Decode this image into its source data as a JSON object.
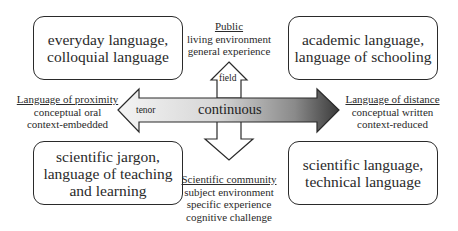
{
  "boxes": {
    "top_left": {
      "lines": [
        "everyday language,",
        "colloquial language"
      ]
    },
    "top_right": {
      "lines": [
        "academic language,",
        "language of schooling"
      ]
    },
    "bottom_left": {
      "lines": [
        "scientific jargon,",
        "language of teaching",
        "and learning"
      ]
    },
    "bottom_right": {
      "lines": [
        "scientific language,",
        "technical language"
      ]
    }
  },
  "poles": {
    "top": {
      "heading": "Public",
      "lines": [
        "living environment",
        "general experience"
      ]
    },
    "bottom": {
      "heading": "Scientific community",
      "lines": [
        "subject environment",
        "specific experience",
        "cognitive challenge"
      ]
    },
    "left": {
      "heading": "Language of proximity",
      "lines": [
        "conceptual oral",
        "context-embedded"
      ]
    },
    "right": {
      "heading": "Language of distance",
      "lines": [
        "conceptual written",
        "context-reduced"
      ]
    }
  },
  "arrows": {
    "horizontal_center_label": "continuous",
    "horizontal_side_label": "tenor",
    "vertical_label": "field",
    "colors": {
      "gradient_light": "#f2f2f2",
      "gradient_dark": "#3a3a3a",
      "outline": "#2a2a2a"
    }
  }
}
